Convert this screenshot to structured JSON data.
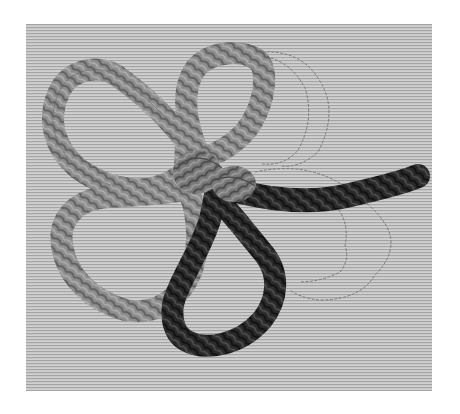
{
  "image": {
    "subject": "embroidered three-leaf clover with braided cord outlines on woven fabric",
    "background_color": "#ffffff",
    "fabric": {
      "x": 26,
      "y": 24,
      "width": 406,
      "height": 367,
      "base_color": "#c6c6c6",
      "stripe_color": "#9e9e9e"
    },
    "colors": {
      "cord_light": "#8e8e8e",
      "cord_light_dark": "#5e5e5e",
      "cord_mid": "#6f6f6f",
      "cord_dark": "#2a2a2a",
      "cord_darkest": "#141414",
      "outline_stitch": "#7a7a7a"
    },
    "elements": [
      {
        "name": "top-left-heart-leaf",
        "stitched": true,
        "tone": "light"
      },
      {
        "name": "top-right-heart-leaf",
        "stitched": true,
        "tone": "light"
      },
      {
        "name": "bottom-left-heart-leaf",
        "stitched": true,
        "tone": "light"
      },
      {
        "name": "bottom-right-heart-leaf",
        "stitched": true,
        "tone": "dark"
      },
      {
        "name": "center-knot",
        "stitched": true,
        "tone": "mid"
      },
      {
        "name": "stem",
        "stitched": true,
        "tone": "dark"
      },
      {
        "name": "upper-right-outline-leaf",
        "stitched": false,
        "tone": "outline"
      },
      {
        "name": "right-outline-leaf",
        "stitched": false,
        "tone": "outline"
      }
    ]
  }
}
